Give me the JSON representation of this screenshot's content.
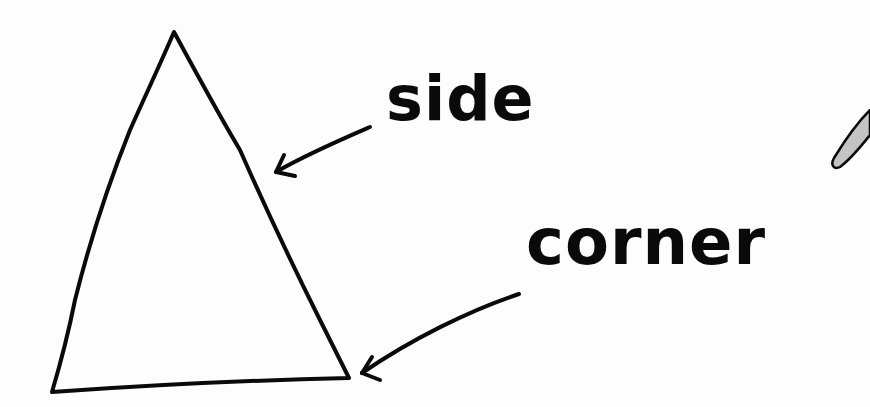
{
  "diagram": {
    "shape": "triangle",
    "labels": {
      "side": "side",
      "corner": "corner"
    },
    "colors": {
      "background": "#fdfdfd",
      "stroke": "#0a0a0a",
      "pencil_fill": "#c4c4c4"
    }
  }
}
